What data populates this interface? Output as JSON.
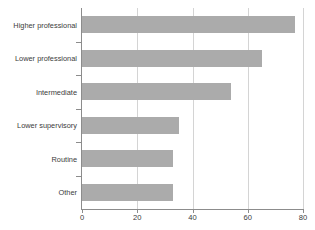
{
  "chart_data": {
    "type": "bar",
    "orientation": "horizontal",
    "title": "",
    "xlabel": "",
    "ylabel": "",
    "categories": [
      "Higher professional",
      "Lower professional",
      "Intermediate",
      "Lower supervisory",
      "Routine",
      "Other"
    ],
    "values": [
      77,
      65,
      54,
      35,
      33,
      33
    ],
    "xlim": [
      0,
      80
    ],
    "xticks": [
      0,
      20,
      40,
      60,
      80
    ],
    "xtick_labels": [
      "0",
      "20",
      "40",
      "60",
      "80"
    ],
    "grid": true,
    "grid_axis": "x",
    "legend": false,
    "bar_color": "#ababab",
    "axis_color": "#8c8c8c",
    "grid_color": "#d4d4d4",
    "text_color": "#3b3b3b"
  }
}
